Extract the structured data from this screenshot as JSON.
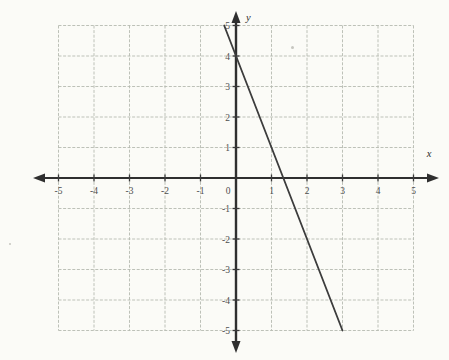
{
  "figure": {
    "background": "#fbfbf7",
    "grid_color": "#b6bab0",
    "axis_color": "#2f2f2f",
    "line_color": "#3c3c3c",
    "label_color": "#4f4f4f",
    "tick_color": "#3a3a3a"
  },
  "chart_data": {
    "type": "line",
    "title": "",
    "xlabel": "x",
    "ylabel": "y",
    "xlim": [
      -5,
      5
    ],
    "ylim": [
      -5,
      5
    ],
    "grid": true,
    "x_ticks": [
      -5,
      -4,
      -3,
      -2,
      -1,
      0,
      1,
      2,
      3,
      4,
      5
    ],
    "y_ticks": [
      -5,
      -4,
      -3,
      -2,
      -1,
      1,
      2,
      3,
      4,
      5
    ],
    "x_tick_labels": [
      "-5",
      "-4",
      "-3",
      "-2",
      "-1",
      "0",
      "1",
      "2",
      "3",
      "4",
      "5"
    ],
    "y_tick_labels": [
      "-5",
      "-4",
      "-3",
      "-2",
      "-1",
      "1",
      "2",
      "3",
      "4",
      "5"
    ],
    "origin_label": "0",
    "series": [
      {
        "name": "plotted-line",
        "slope": -3,
        "y_intercept": 4,
        "x_intercept": 1.33,
        "segment": [
          [
            -0.333,
            5
          ],
          [
            3,
            -5
          ]
        ]
      }
    ]
  }
}
